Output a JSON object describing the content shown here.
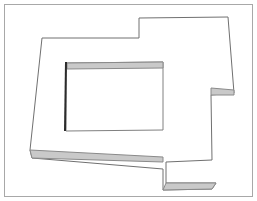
{
  "document": {
    "title": "Floor Slab Outline Drawing",
    "type": "vector-line-drawing",
    "caption": "",
    "background_color": "#ffffff",
    "canvas": {
      "width": 257,
      "height": 201
    }
  },
  "frame": {
    "name": "image-border",
    "stroke_color": "#a8a8a8",
    "stroke_width": 1,
    "x": 4,
    "y": 4,
    "width": 249,
    "height": 193
  },
  "styles": {
    "outline_stroke": "#707070",
    "outline_stroke_width": 1,
    "inner_stroke": "#808080",
    "inner_stroke_width": 1,
    "edge_band_fill": "#c9c9c9",
    "edge_band_stroke": "#8a8a8a",
    "thick_edge_stroke": "#2b2b2b",
    "thick_edge_width": 2,
    "face_fill": "#ffffff"
  },
  "geometry": {
    "outer_outline": {
      "name": "slab-top-face-outline",
      "closed": true,
      "points": [
        [
          42,
          38
        ],
        [
          139,
          38
        ],
        [
          139,
          18
        ],
        [
          228,
          17
        ],
        [
          234,
          93
        ],
        [
          211,
          95
        ],
        [
          212,
          160
        ],
        [
          166,
          162
        ],
        [
          166,
          183
        ],
        [
          216,
          183
        ],
        [
          212,
          189
        ],
        [
          163,
          190
        ],
        [
          163,
          169
        ],
        [
          32,
          158
        ],
        [
          30,
          150
        ]
      ]
    },
    "inner_outline": {
      "name": "slab-opening-outline",
      "closed": true,
      "points": [
        [
          66,
          63
        ],
        [
          163,
          62
        ],
        [
          163,
          130
        ],
        [
          66,
          131
        ]
      ]
    },
    "bands": [
      {
        "name": "edge-band-bottom-left",
        "points": [
          [
            30,
            150
          ],
          [
            163,
            157
          ],
          [
            163,
            162
          ],
          [
            32,
            158
          ]
        ]
      },
      {
        "name": "edge-band-bottom-right",
        "points": [
          [
            166,
            183
          ],
          [
            216,
            183
          ],
          [
            212,
            189
          ],
          [
            163,
            190
          ]
        ]
      },
      {
        "name": "edge-band-right-ledge",
        "points": [
          [
            211,
            88
          ],
          [
            234,
            90
          ],
          [
            234,
            95
          ],
          [
            211,
            95
          ]
        ]
      },
      {
        "name": "edge-band-opening-top",
        "points": [
          [
            67,
            63
          ],
          [
            163,
            62
          ],
          [
            163,
            68
          ],
          [
            67,
            69
          ]
        ]
      }
    ],
    "thick_edges": [
      {
        "name": "opening-left-riser",
        "from": [
          66,
          62
        ],
        "to": [
          65,
          131
        ]
      }
    ]
  },
  "labels": {
    "annotations": []
  }
}
